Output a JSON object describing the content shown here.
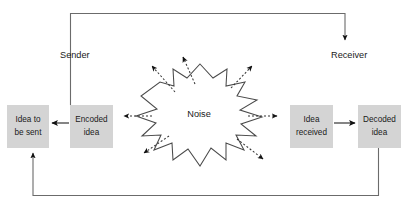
{
  "diagram": {
    "background_color": "#ffffff",
    "box_fill_color": "#d4d4d4",
    "line_color": "#4d4d4d",
    "arrow_color": "#111111",
    "text_color": "#1a1a1a"
  },
  "roles": {
    "sender_label": "Sender",
    "receiver_label": "Receiver"
  },
  "boxes": [
    {
      "id": "idea-to-be-sent",
      "line1": "Idea to",
      "line2": "be sent"
    },
    {
      "id": "encoded-idea",
      "line1": "Encoded",
      "line2": "idea"
    },
    {
      "id": "idea-received",
      "line1": "Idea",
      "line2": "received"
    },
    {
      "id": "decoded-idea",
      "line1": "Decoded",
      "line2": "idea"
    }
  ],
  "noise": {
    "label": "Noise",
    "burst_shape": "starburst",
    "ray_count": 6
  },
  "connectors": {
    "encoded_to_idea": "arrow-left-solid",
    "received_to_decoded": "arrow-right-solid",
    "top_feedback": "arrow-down-solid",
    "bottom_feedback": "arrow-up-solid"
  }
}
